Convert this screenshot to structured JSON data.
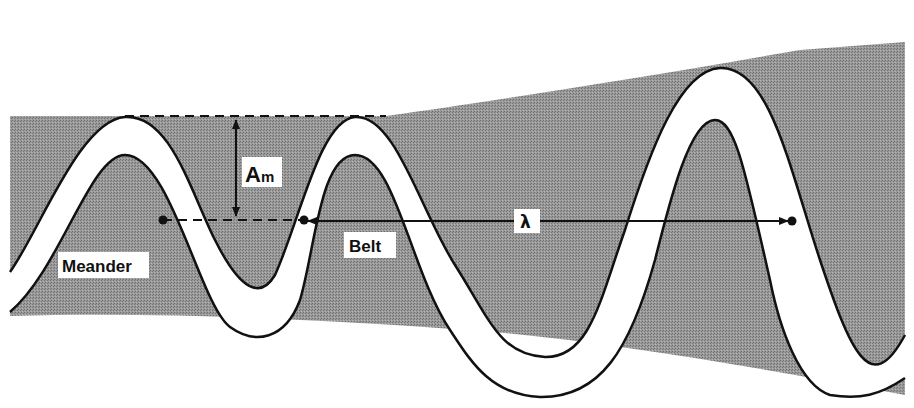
{
  "figure": {
    "type": "meander belt diagram",
    "labels": {
      "amplitude_main": "A",
      "amplitude_sub": "m",
      "wavelength": "λ",
      "belt": "Belt",
      "meander": "Meander"
    },
    "colors": {
      "belt_fill": "#8f8f8f",
      "channel_fill": "#ffffff",
      "outline": "#111111",
      "background": "#ffffff"
    },
    "annotations": {
      "amplitude_arrow": "double-headed vertical arrow between top dashed line and centre dashed line",
      "wavelength_arrow": "double-headed horizontal arrow between two channel centre points"
    }
  }
}
